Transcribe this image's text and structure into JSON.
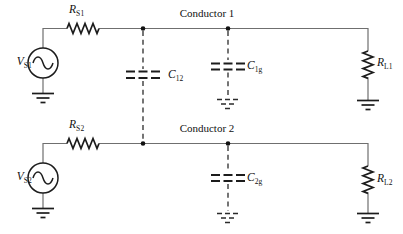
{
  "diagram": {
    "type": "circuit-schematic",
    "conductor1_label": "Conductor 1",
    "conductor2_label": "Conductor 2",
    "components": {
      "vs1": {
        "name": "V",
        "sub": "S1",
        "kind": "ac-voltage-source"
      },
      "rs1": {
        "name": "R",
        "sub": "S1",
        "kind": "resistor"
      },
      "rl1": {
        "name": "R",
        "sub": "L1",
        "kind": "resistor"
      },
      "vs2": {
        "name": "V",
        "sub": "S2",
        "kind": "ac-voltage-source"
      },
      "rs2": {
        "name": "R",
        "sub": "S2",
        "kind": "resistor"
      },
      "rl2": {
        "name": "R",
        "sub": "L2",
        "kind": "resistor"
      },
      "c12": {
        "name": "C",
        "sub": "12",
        "kind": "stray-capacitance"
      },
      "c1g": {
        "name": "C",
        "sub": "1g",
        "kind": "stray-capacitance"
      },
      "c2g": {
        "name": "C",
        "sub": "2g",
        "kind": "stray-capacitance"
      }
    },
    "colors": {
      "background": "#ffffff",
      "wire": "#6f6f6f",
      "symbol": "#1c1c1c",
      "text": "#111111"
    }
  }
}
